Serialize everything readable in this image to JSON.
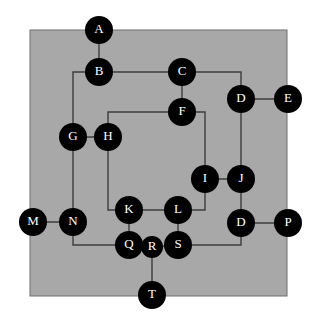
{
  "figure": {
    "type": "node-link-graph",
    "width": 317,
    "height": 324,
    "background_color": "#ffffff",
    "panel": {
      "name": "gray-panel",
      "x": 30,
      "y": 30,
      "width": 257,
      "height": 266,
      "fill_color": "#a8a8a8",
      "border_color": "#6e6e6e"
    },
    "style": {
      "node_fill": "#000000",
      "node_label_color": "#ffffff",
      "edge_color": "#3c3c3c",
      "edge_width": 1.4,
      "node_radius": 13,
      "node_radius_small": 10,
      "label_font_size": 13
    }
  },
  "nodes": [
    {
      "id": "A",
      "label": "A",
      "cx": 99,
      "cy": 30,
      "r": 14
    },
    {
      "id": "B",
      "label": "B",
      "cx": 99,
      "cy": 72,
      "r": 14
    },
    {
      "id": "C",
      "label": "C",
      "cx": 182,
      "cy": 72,
      "r": 14
    },
    {
      "id": "D1",
      "label": "D",
      "cx": 241,
      "cy": 99,
      "r": 14
    },
    {
      "id": "E",
      "label": "E",
      "cx": 288,
      "cy": 99,
      "r": 14
    },
    {
      "id": "F",
      "label": "F",
      "cx": 182,
      "cy": 112,
      "r": 14
    },
    {
      "id": "G",
      "label": "G",
      "cx": 73,
      "cy": 137,
      "r": 14
    },
    {
      "id": "H",
      "label": "H",
      "cx": 108,
      "cy": 137,
      "r": 14
    },
    {
      "id": "I",
      "label": "I",
      "cx": 205,
      "cy": 179,
      "r": 14
    },
    {
      "id": "J",
      "label": "J",
      "cx": 241,
      "cy": 179,
      "r": 14
    },
    {
      "id": "K",
      "label": "K",
      "cx": 129,
      "cy": 210,
      "r": 14
    },
    {
      "id": "L",
      "label": "L",
      "cx": 178,
      "cy": 210,
      "r": 14
    },
    {
      "id": "M",
      "label": "M",
      "cx": 33,
      "cy": 222,
      "r": 14
    },
    {
      "id": "N",
      "label": "N",
      "cx": 73,
      "cy": 222,
      "r": 14
    },
    {
      "id": "D2",
      "label": "D",
      "cx": 241,
      "cy": 223,
      "r": 14
    },
    {
      "id": "P",
      "label": "P",
      "cx": 288,
      "cy": 223,
      "r": 14
    },
    {
      "id": "Q",
      "label": "Q",
      "cx": 129,
      "cy": 245,
      "r": 14
    },
    {
      "id": "R",
      "label": "R",
      "cx": 152,
      "cy": 247,
      "r": 11
    },
    {
      "id": "S",
      "label": "S",
      "cx": 178,
      "cy": 245,
      "r": 14
    },
    {
      "id": "T",
      "label": "T",
      "cx": 152,
      "cy": 295,
      "r": 14
    }
  ],
  "edges": [
    {
      "id": "A-B",
      "from": "A",
      "to": "B",
      "points": "99,30 99,72"
    },
    {
      "id": "B-C",
      "from": "B",
      "to": "C",
      "points": "99,72 182,72"
    },
    {
      "id": "B-G",
      "from": "B",
      "to": "G",
      "points": "99,72 73,72 73,137"
    },
    {
      "id": "C-F",
      "from": "C",
      "to": "F",
      "points": "182,72 182,112"
    },
    {
      "id": "C-D1",
      "from": "C",
      "to": "D1",
      "points": "182,72 241,72 241,99"
    },
    {
      "id": "D1-E",
      "from": "D1",
      "to": "E",
      "points": "241,99 288,99"
    },
    {
      "id": "D1-J",
      "from": "D1",
      "to": "J",
      "points": "241,99 241,179"
    },
    {
      "id": "F-H",
      "from": "F",
      "to": "H",
      "points": "182,112 108,112 108,137"
    },
    {
      "id": "F-I",
      "from": "F",
      "to": "I",
      "points": "182,112 205,112 205,179"
    },
    {
      "id": "G-H",
      "from": "G",
      "to": "H",
      "points": "73,137 108,137"
    },
    {
      "id": "G-N",
      "from": "G",
      "to": "N",
      "points": "73,137 73,222"
    },
    {
      "id": "H-K",
      "from": "H",
      "to": "K",
      "points": "108,137 108,210 129,210"
    },
    {
      "id": "I-J",
      "from": "I",
      "to": "J",
      "points": "205,179 241,179"
    },
    {
      "id": "I-L",
      "from": "I",
      "to": "L",
      "points": "205,179 205,210 178,210"
    },
    {
      "id": "J-D2",
      "from": "J",
      "to": "D2",
      "points": "241,179 241,223"
    },
    {
      "id": "K-L",
      "from": "K",
      "to": "L",
      "points": "129,210 178,210"
    },
    {
      "id": "K-Q",
      "from": "K",
      "to": "Q",
      "points": "129,210 129,245"
    },
    {
      "id": "L-S",
      "from": "L",
      "to": "S",
      "points": "178,210 178,245"
    },
    {
      "id": "M-N",
      "from": "M",
      "to": "N",
      "points": "33,222 73,222"
    },
    {
      "id": "N-Q",
      "from": "N",
      "to": "Q",
      "points": "73,222 73,245 129,245"
    },
    {
      "id": "D2-P",
      "from": "D2",
      "to": "P",
      "points": "241,223 288,223"
    },
    {
      "id": "D2-S",
      "from": "D2",
      "to": "S",
      "points": "241,223 241,245 178,245"
    },
    {
      "id": "Q-R",
      "from": "Q",
      "to": "R",
      "points": "129,245 152,247"
    },
    {
      "id": "R-S",
      "from": "R",
      "to": "S",
      "points": "152,247 178,245"
    },
    {
      "id": "R-T",
      "from": "R",
      "to": "T",
      "points": "152,247 152,295"
    }
  ]
}
